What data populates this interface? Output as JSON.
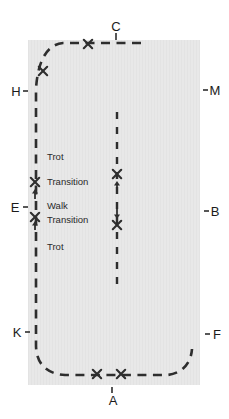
{
  "diagram": {
    "type": "dressage-arena-schooling-figure",
    "colors": {
      "arena_fill": "#e8e8e8",
      "line": "#2e2e2e",
      "text": "#1b1b1b"
    },
    "letters": [
      {
        "label": "C",
        "x": 116,
        "y": 26,
        "tick": {
          "x1": 116,
          "y1": 33,
          "x2": 116,
          "y2": 40
        }
      },
      {
        "label": "H",
        "x": 16,
        "y": 91,
        "tick": {
          "x1": 23,
          "y1": 91,
          "x2": 28,
          "y2": 91
        }
      },
      {
        "label": "M",
        "x": 215,
        "y": 90,
        "tick": {
          "x1": 203,
          "y1": 90,
          "x2": 208,
          "y2": 90
        }
      },
      {
        "label": "E",
        "x": 15,
        "y": 207,
        "tick": {
          "x1": 23,
          "y1": 207,
          "x2": 28,
          "y2": 207
        }
      },
      {
        "label": "B",
        "x": 215,
        "y": 211,
        "tick": {
          "x1": 204,
          "y1": 211,
          "x2": 209,
          "y2": 211
        }
      },
      {
        "label": "K",
        "x": 17,
        "y": 332,
        "tick": {
          "x1": 25,
          "y1": 332,
          "x2": 30,
          "y2": 332
        }
      },
      {
        "label": "F",
        "x": 217,
        "y": 334,
        "tick": {
          "x1": 205,
          "y1": 334,
          "x2": 210,
          "y2": 334
        }
      },
      {
        "label": "A",
        "x": 113,
        "y": 400,
        "tick": {
          "x1": 112,
          "y1": 387,
          "x2": 112,
          "y2": 393
        }
      }
    ],
    "movement_labels": [
      {
        "text": "Trot",
        "x": 47,
        "y": 157
      },
      {
        "text": "Transition",
        "x": 47,
        "y": 182
      },
      {
        "text": "Walk",
        "x": 47,
        "y": 206
      },
      {
        "text": "Transition",
        "x": 47,
        "y": 220
      },
      {
        "text": "Trot",
        "x": 47,
        "y": 247
      }
    ],
    "cross_markers": [
      {
        "x": 88,
        "y": 44
      },
      {
        "x": 43,
        "y": 71
      },
      {
        "x": 35,
        "y": 182
      },
      {
        "x": 35,
        "y": 217
      },
      {
        "x": 117,
        "y": 174
      },
      {
        "x": 117,
        "y": 225
      },
      {
        "x": 97,
        "y": 374
      },
      {
        "x": 121,
        "y": 374
      }
    ],
    "transition_arrows": [
      {
        "x": 35,
        "tail": 199,
        "tip": 189
      },
      {
        "x": 35,
        "tail": 230,
        "tip": 221
      },
      {
        "x": 117,
        "tail": 191,
        "tip": 181
      },
      {
        "x": 117,
        "tail": 207,
        "tip": 219
      }
    ]
  }
}
